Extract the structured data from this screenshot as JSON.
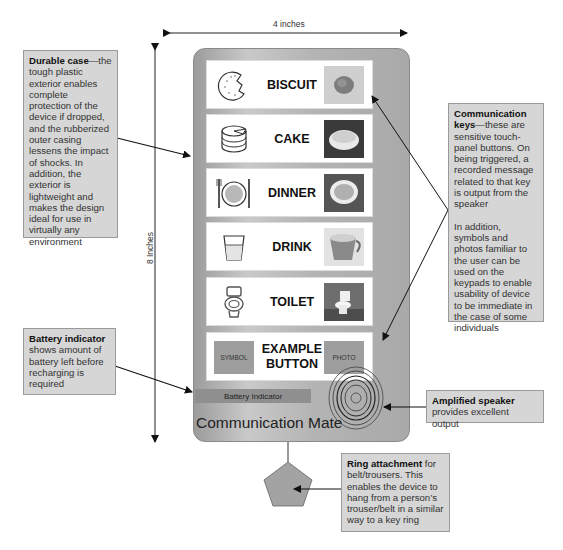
{
  "dimensions": {
    "width_label": "4 inches",
    "height_label": "8 Inches"
  },
  "device": {
    "name": "Communication Mate",
    "battery_label": "Battery Indicator",
    "colors": {
      "case": "#b4b4b4",
      "key_bg": "#ffffff",
      "battery": "#8f8f8f"
    },
    "keys": [
      {
        "label": "BISCUIT",
        "symbol": "biscuit-icon",
        "photo": "biscuit-photo"
      },
      {
        "label": "CAKE",
        "symbol": "cake-icon",
        "photo": "cake-photo"
      },
      {
        "label": "DINNER",
        "symbol": "dinner-plate-icon",
        "photo": "dinner-photo"
      },
      {
        "label": "DRINK",
        "symbol": "cup-icon",
        "photo": "mug-photo"
      },
      {
        "label": "TOILET",
        "symbol": "toilet-icon",
        "photo": "toilet-photo"
      }
    ],
    "example_key": {
      "label_line1": "EXAMPLE",
      "label_line2": "BUTTON",
      "symbol_label": "SYMBOL",
      "photo_label": "PHOTO"
    }
  },
  "callouts": {
    "durable_case": {
      "title": "Durable case",
      "text": "—the tough plastic exterior enables complete protection of the device if dropped, and the rubberized outer casing lessens the impact of shocks. In addition, the exterior is lightweight and makes the design ideal for use in virtually any environment"
    },
    "communication_keys": {
      "title": "Communication keys",
      "text": "—these are sensitive touch-panel buttons. On being triggered, a recorded message related to that key is output from the speaker",
      "text2": "In addition, symbols and photos familiar to the user can be used on the keypads to enable usability of device to be immediate in the case of some individuals"
    },
    "battery_indicator": {
      "title": "Battery indicator",
      "text": " shows amount of battery left before recharging is required"
    },
    "amplified_speaker": {
      "title": "Amplified speaker",
      "text": "provides excellent output"
    },
    "ring_attachment": {
      "title": "Ring attachment",
      "text": " for belt/trousers. This enables the device to hang from a person’s trouser/belt in a similar way to a key ring"
    }
  }
}
